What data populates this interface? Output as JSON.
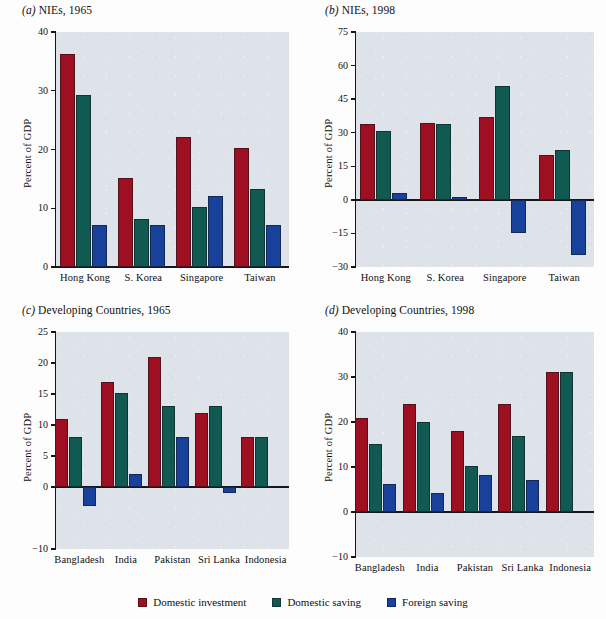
{
  "figure": {
    "legend": {
      "items": [
        {
          "label": "Domestic investment",
          "color": "#9e0f22",
          "key": "domestic_investment"
        },
        {
          "label": "Domestic saving",
          "color": "#115a52",
          "key": "domestic_saving"
        },
        {
          "label": "Foreign saving",
          "color": "#17419a",
          "key": "foreign_saving"
        }
      ]
    },
    "panels": [
      {
        "id": "a",
        "letter": "(a)",
        "title": "NIEs, 1965"
      },
      {
        "id": "b",
        "letter": "(b)",
        "title": "NIEs, 1998"
      },
      {
        "id": "c",
        "letter": "(c)",
        "title": "Developing Countries, 1965"
      },
      {
        "id": "d",
        "letter": "(d)",
        "title": "Developing Countries, 1998"
      }
    ]
  },
  "chart_data": [
    {
      "panel": "a",
      "type": "bar",
      "title": "(a) NIEs, 1965",
      "xlabel": "",
      "ylabel": "Percent of GDP",
      "ylim": [
        0,
        40
      ],
      "yticks": [
        0,
        10,
        20,
        30,
        40
      ],
      "grid": false,
      "legend_position": "figure-bottom",
      "categories": [
        "Hong Kong",
        "S. Korea",
        "Singapore",
        "Taiwan"
      ],
      "series": [
        {
          "name": "Domestic investment",
          "color": "#9e0f22",
          "values": [
            36.3,
            15.2,
            22.1,
            20.3
          ]
        },
        {
          "name": "Domestic saving",
          "color": "#115a52",
          "values": [
            29.2,
            8.2,
            10.2,
            13.2
          ]
        },
        {
          "name": "Foreign saving",
          "color": "#17419a",
          "values": [
            7.2,
            7.2,
            12.1,
            7.2
          ]
        }
      ]
    },
    {
      "panel": "b",
      "type": "bar",
      "title": "(b) NIEs, 1998",
      "xlabel": "",
      "ylabel": "Percent of GDP",
      "ylim": [
        -30,
        75
      ],
      "yticks": [
        -30,
        -15,
        0,
        15,
        30,
        45,
        60,
        75
      ],
      "grid": false,
      "legend_position": "figure-bottom",
      "categories": [
        "Hong Kong",
        "S. Korea",
        "Singapore",
        "Taiwan"
      ],
      "series": [
        {
          "name": "Domestic investment",
          "color": "#9e0f22",
          "values": [
            33.8,
            34.5,
            36.8,
            20.0
          ]
        },
        {
          "name": "Domestic saving",
          "color": "#115a52",
          "values": [
            30.8,
            33.8,
            51.0,
            22.3
          ]
        },
        {
          "name": "Foreign saving",
          "color": "#17419a",
          "values": [
            3.0,
            1.2,
            -14.8,
            -24.5
          ]
        }
      ]
    },
    {
      "panel": "c",
      "type": "bar",
      "title": "(c) Developing Countries, 1965",
      "xlabel": "",
      "ylabel": "Percent of GDP",
      "ylim": [
        -10,
        25
      ],
      "yticks": [
        -10,
        0,
        5,
        10,
        15,
        20,
        25
      ],
      "grid": false,
      "legend_position": "figure-bottom",
      "categories": [
        "Bangladesh",
        "India",
        "Pakistan",
        "Sri Lanka",
        "Indonesia"
      ],
      "series": [
        {
          "name": "Domestic investment",
          "color": "#9e0f22",
          "values": [
            10.9,
            17.0,
            20.9,
            12.0,
            8.0
          ]
        },
        {
          "name": "Domestic saving",
          "color": "#115a52",
          "values": [
            8.0,
            15.1,
            13.1,
            13.1,
            8.0
          ]
        },
        {
          "name": "Foreign saving",
          "color": "#17419a",
          "values": [
            -3.0,
            2.1,
            8.1,
            -1.0,
            0.0
          ]
        }
      ]
    },
    {
      "panel": "d",
      "type": "bar",
      "title": "(d) Developing Countries, 1998",
      "xlabel": "",
      "ylabel": "Percent of GDP",
      "ylim": [
        -10,
        40
      ],
      "yticks": [
        -10,
        0,
        10,
        20,
        30,
        40
      ],
      "grid": false,
      "legend_position": "figure-bottom",
      "categories": [
        "Bangladesh",
        "India",
        "Pakistan",
        "Sri Lanka",
        "Indonesia"
      ],
      "series": [
        {
          "name": "Domestic investment",
          "color": "#9e0f22",
          "values": [
            21.0,
            24.1,
            18.1,
            24.1,
            31.2
          ]
        },
        {
          "name": "Domestic saving",
          "color": "#115a52",
          "values": [
            15.1,
            20.1,
            10.2,
            17.0,
            31.2
          ]
        },
        {
          "name": "Foreign saving",
          "color": "#17419a",
          "values": [
            6.2,
            4.2,
            8.2,
            7.1,
            0.0
          ]
        }
      ]
    }
  ]
}
